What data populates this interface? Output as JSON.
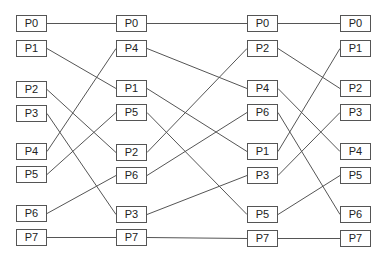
{
  "diagram": {
    "line_color": "#555555",
    "box_border_color": "#555555",
    "columns": [
      {
        "x": 16,
        "nodes": [
          {
            "label": "P0",
            "y": 15
          },
          {
            "label": "P1",
            "y": 40
          },
          {
            "label": "P2",
            "y": 81
          },
          {
            "label": "P3",
            "y": 105
          },
          {
            "label": "P4",
            "y": 143
          },
          {
            "label": "P5",
            "y": 166
          },
          {
            "label": "P6",
            "y": 205
          },
          {
            "label": "P7",
            "y": 229
          }
        ]
      },
      {
        "x": 116,
        "nodes": [
          {
            "label": "P0",
            "y": 15
          },
          {
            "label": "P4",
            "y": 40
          },
          {
            "label": "P1",
            "y": 80
          },
          {
            "label": "P5",
            "y": 104
          },
          {
            "label": "P2",
            "y": 144
          },
          {
            "label": "P6",
            "y": 167
          },
          {
            "label": "P3",
            "y": 206
          },
          {
            "label": "P7",
            "y": 229
          }
        ]
      },
      {
        "x": 247,
        "nodes": [
          {
            "label": "P0",
            "y": 15
          },
          {
            "label": "P2",
            "y": 40
          },
          {
            "label": "P4",
            "y": 80
          },
          {
            "label": "P6",
            "y": 104
          },
          {
            "label": "P1",
            "y": 143
          },
          {
            "label": "P3",
            "y": 167
          },
          {
            "label": "P5",
            "y": 206
          },
          {
            "label": "P7",
            "y": 230
          }
        ]
      },
      {
        "x": 340,
        "nodes": [
          {
            "label": "P0",
            "y": 15
          },
          {
            "label": "P1",
            "y": 40
          },
          {
            "label": "P2",
            "y": 80
          },
          {
            "label": "P3",
            "y": 104
          },
          {
            "label": "P4",
            "y": 143
          },
          {
            "label": "P5",
            "y": 167
          },
          {
            "label": "P6",
            "y": 206
          },
          {
            "label": "P7",
            "y": 230
          }
        ]
      }
    ]
  }
}
